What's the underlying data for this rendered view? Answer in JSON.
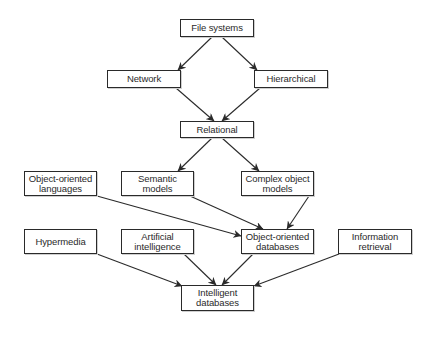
{
  "diagram": {
    "type": "flowchart",
    "nodes": [
      {
        "id": "file_systems",
        "label": "File systems",
        "x": 180,
        "y": 19,
        "w": 74,
        "h": 18
      },
      {
        "id": "network",
        "label": "Network",
        "x": 107,
        "y": 70,
        "w": 74,
        "h": 18
      },
      {
        "id": "hierarchical",
        "label": "Hierarchical",
        "x": 254,
        "y": 70,
        "w": 74,
        "h": 18
      },
      {
        "id": "relational",
        "label": "Relational",
        "x": 180,
        "y": 121,
        "w": 74,
        "h": 17
      },
      {
        "id": "oo_languages",
        "label": "Object-oriented\nlanguages",
        "x": 24,
        "y": 171,
        "w": 73,
        "h": 25
      },
      {
        "id": "semantic_models",
        "label": "Semantic\nmodels",
        "x": 121,
        "y": 171,
        "w": 73,
        "h": 25
      },
      {
        "id": "complex_object_models",
        "label": "Complex object\nmodels",
        "x": 241,
        "y": 171,
        "w": 73,
        "h": 25
      },
      {
        "id": "hypermedia",
        "label": "Hypermedia",
        "x": 24,
        "y": 229,
        "w": 73,
        "h": 25
      },
      {
        "id": "artificial_intelligence",
        "label": "Artificial\nintelligence",
        "x": 121,
        "y": 229,
        "w": 73,
        "h": 25
      },
      {
        "id": "oo_databases",
        "label": "Object-oriented\ndatabases",
        "x": 241,
        "y": 229,
        "w": 73,
        "h": 25
      },
      {
        "id": "information_retrieval",
        "label": "Information\nretrieval",
        "x": 338,
        "y": 229,
        "w": 74,
        "h": 25
      },
      {
        "id": "intelligent_databases",
        "label": "Intelligent\ndatabases",
        "x": 181,
        "y": 285,
        "w": 73,
        "h": 26
      }
    ],
    "edges": [
      {
        "from": "file_systems",
        "to": "network",
        "x1": 212,
        "y1": 37,
        "x2": 178,
        "y2": 70
      },
      {
        "from": "file_systems",
        "to": "hierarchical",
        "x1": 222,
        "y1": 37,
        "x2": 257,
        "y2": 70
      },
      {
        "from": "network",
        "to": "relational",
        "x1": 176,
        "y1": 88,
        "x2": 214,
        "y2": 121
      },
      {
        "from": "hierarchical",
        "to": "relational",
        "x1": 260,
        "y1": 88,
        "x2": 222,
        "y2": 121
      },
      {
        "from": "relational",
        "to": "semantic_models",
        "x1": 212,
        "y1": 138,
        "x2": 178,
        "y2": 171
      },
      {
        "from": "relational",
        "to": "complex_object_models",
        "x1": 222,
        "y1": 138,
        "x2": 259,
        "y2": 171
      },
      {
        "from": "oo_languages",
        "to": "oo_databases",
        "x1": 97,
        "y1": 196,
        "x2": 241,
        "y2": 236
      },
      {
        "from": "semantic_models",
        "to": "oo_databases",
        "x1": 190,
        "y1": 196,
        "x2": 263,
        "y2": 229
      },
      {
        "from": "complex_object_models",
        "to": "oo_databases",
        "x1": 309,
        "y1": 196,
        "x2": 287,
        "y2": 229
      },
      {
        "from": "hypermedia",
        "to": "intelligent_databases",
        "x1": 97,
        "y1": 254,
        "x2": 182,
        "y2": 286
      },
      {
        "from": "artificial_intelligence",
        "to": "intelligent_databases",
        "x1": 184,
        "y1": 254,
        "x2": 216,
        "y2": 285
      },
      {
        "from": "oo_databases",
        "to": "intelligent_databases",
        "x1": 253,
        "y1": 254,
        "x2": 222,
        "y2": 285
      },
      {
        "from": "information_retrieval",
        "to": "intelligent_databases",
        "x1": 339,
        "y1": 254,
        "x2": 254,
        "y2": 286
      }
    ]
  },
  "colors": {
    "stroke": "#2a2a2a",
    "background": "#ffffff",
    "shadow": "#cfcfcf"
  }
}
